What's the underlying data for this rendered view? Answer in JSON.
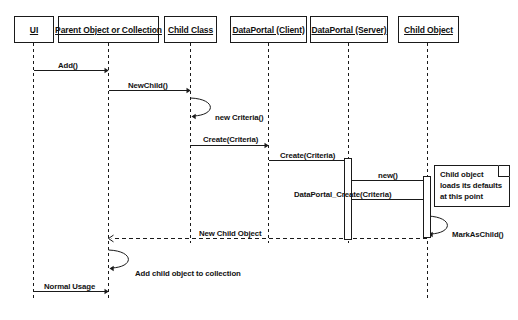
{
  "diagram": {
    "type": "uml-sequence-diagram",
    "background_color": "#ffffff",
    "line_color": "#1a1a1a",
    "text_color": "#111111"
  },
  "participants": [
    {
      "id": "ui",
      "label": "UI",
      "x": 33,
      "box_left": 14,
      "box_width": 40,
      "lifeline_bottom": 300
    },
    {
      "id": "parent",
      "label": "Parent Object or Collection",
      "x": 108,
      "box_left": 58,
      "box_width": 101,
      "lifeline_bottom": 300
    },
    {
      "id": "childclass",
      "label": "Child Class",
      "x": 190,
      "box_left": 164,
      "box_width": 53,
      "lifeline_bottom": 243
    },
    {
      "id": "dp_client",
      "label": "DataPortal (Client)",
      "x": 268,
      "box_left": 230,
      "box_width": 77,
      "lifeline_bottom": 243
    },
    {
      "id": "dp_server",
      "label": "DataPortal (Server)",
      "x": 348,
      "box_left": 310,
      "box_width": 78,
      "lifeline_bottom": 243
    },
    {
      "id": "childobject",
      "label": "Child Object",
      "x": 427,
      "box_left": 398,
      "box_width": 61,
      "lifeline_bottom": 300
    }
  ],
  "messages": [
    {
      "id": "m1",
      "label": "Add()",
      "from": "ui",
      "to": "parent",
      "y": 70,
      "style": "solid",
      "arrow": "filled",
      "label_x": 58,
      "label_y": 62
    },
    {
      "id": "m2",
      "label": "NewChild()",
      "from": "parent",
      "to": "childclass",
      "y": 90,
      "style": "solid",
      "arrow": "filled",
      "label_x": 128,
      "label_y": 82
    },
    {
      "id": "m3",
      "label": "new Criteria()",
      "from": "childclass",
      "to": "childclass",
      "y": 110,
      "style": "self",
      "arrow": "filled",
      "label_x": 215,
      "label_y": 114
    },
    {
      "id": "m4",
      "label": "Create(Criteria)",
      "from": "childclass",
      "to": "dp_client",
      "y": 145,
      "style": "solid",
      "arrow": "filled",
      "label_x": 203,
      "label_y": 136
    },
    {
      "id": "m5",
      "label": "Create(Criteria)",
      "from": "dp_client",
      "to": "dp_server",
      "y": 160,
      "style": "solid",
      "arrow": "filled",
      "label_x": 280,
      "label_y": 152
    },
    {
      "id": "m6",
      "label": "new()",
      "from": "dp_server",
      "to": "childobject",
      "y": 180,
      "style": "solid",
      "arrow": "filled",
      "label_x": 378,
      "label_y": 172
    },
    {
      "id": "m7",
      "label": "DataPortal_Create(Criteria)",
      "from": "dp_server",
      "to": "childobject",
      "y": 199,
      "style": "solid",
      "arrow": "filled",
      "label_x": 294,
      "label_y": 191
    },
    {
      "id": "m8",
      "label": "MarkAsChild()",
      "from": "childobject",
      "to": "childobject",
      "y": 228,
      "style": "self",
      "arrow": "filled",
      "label_x": 452,
      "label_y": 231
    },
    {
      "id": "m9",
      "label": "New Child Object",
      "from": "childobject",
      "to": "parent",
      "y": 238,
      "style": "dashed",
      "arrow": "open",
      "label_x": 199,
      "label_y": 230
    },
    {
      "id": "m10",
      "label": "Add child object to collection",
      "from": "parent",
      "to": "parent",
      "y": 262,
      "style": "self",
      "arrow": "filled",
      "label_x": 135,
      "label_y": 270
    },
    {
      "id": "m11",
      "label": "Normal Usage",
      "from": "ui",
      "to": "parent",
      "y": 291,
      "style": "solid",
      "arrow": "filled",
      "label_x": 44,
      "label_y": 283
    }
  ],
  "note": {
    "id": "note-child-defaults",
    "lines": [
      "Child object",
      "loads its defaults",
      "at this point"
    ],
    "x": 434,
    "y": 165,
    "width": 76,
    "height": 42
  },
  "activations": [
    {
      "id": "act-dp-server",
      "participant": "dp_server",
      "x": 344,
      "y": 158,
      "width": 8,
      "height": 82
    },
    {
      "id": "act-child-object",
      "participant": "childobject",
      "x": 423,
      "y": 176,
      "width": 8,
      "height": 62
    }
  ]
}
